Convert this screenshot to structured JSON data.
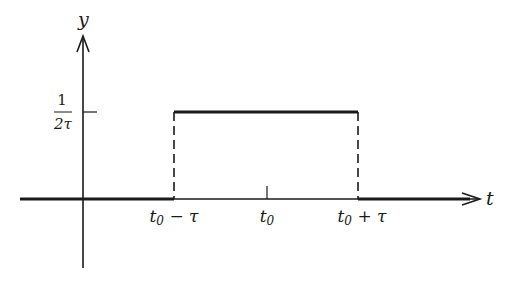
{
  "figure": {
    "type": "rectangular-pulse",
    "axes": {
      "x_label": "t",
      "y_label": "y"
    },
    "y_level_label": {
      "numerator": "1",
      "denominator": "2τ"
    },
    "x_ticks": [
      {
        "label_base": "t",
        "label_sub": "0",
        "label_suffix": " − τ"
      },
      {
        "label_base": "t",
        "label_sub": "0",
        "label_suffix": ""
      },
      {
        "label_base": "t",
        "label_sub": "0",
        "label_suffix": " + τ"
      }
    ],
    "colors": {
      "ink": "#1a1a1a",
      "background": "#ffffff"
    }
  }
}
